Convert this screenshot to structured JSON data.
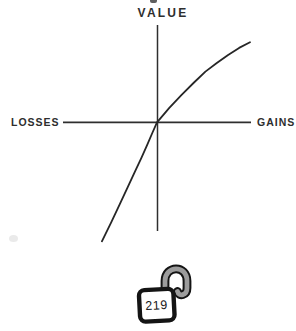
{
  "figure": {
    "ylabel": "VALUE",
    "xlabel_left": "LOSSES",
    "xlabel_right": "GAINS"
  },
  "badge": {
    "icon": "unlocked-padlock-icon",
    "page_number": "219"
  },
  "colors": {
    "background": "#ffffff",
    "ink": "#2e2e2e",
    "lock_outline": "#141414",
    "shackle_gray": "#9c9c9c"
  },
  "chart_data": {
    "type": "line",
    "title": "",
    "ylabel": "VALUE",
    "xlabel_negative_axis": "LOSSES",
    "xlabel_positive_axis": "GAINS",
    "x_range": [
      -4.2,
      4.2
    ],
    "y_range": [
      -5.4,
      4.2
    ],
    "grid": false,
    "tick_labels": "none",
    "legend": "none",
    "series": [
      {
        "name": "value-curve",
        "points": [
          [
            -2.37,
            -5.12
          ],
          [
            -1.97,
            -4.3
          ],
          [
            -1.6,
            -3.52
          ],
          [
            -1.27,
            -2.81
          ],
          [
            -0.96,
            -2.14
          ],
          [
            -0.67,
            -1.53
          ],
          [
            -0.42,
            -0.97
          ],
          [
            -0.2,
            -0.46
          ],
          [
            0,
            0
          ],
          [
            0.53,
            0.62
          ],
          [
            1.06,
            1.18
          ],
          [
            1.57,
            1.69
          ],
          [
            2.08,
            2.18
          ],
          [
            2.57,
            2.55
          ],
          [
            3.06,
            2.9
          ],
          [
            3.53,
            3.2
          ],
          [
            4.0,
            3.44
          ]
        ]
      }
    ]
  }
}
